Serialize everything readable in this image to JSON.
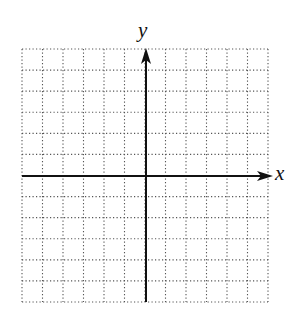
{
  "figure": {
    "type": "coordinate-plane",
    "x_axis_label": "x",
    "y_axis_label": "y",
    "grid": {
      "columns": 12,
      "rows": 12,
      "left": 22,
      "top": 49,
      "right": 268,
      "bottom": 302,
      "line_style": "dotted",
      "line_color": "#555555"
    },
    "axes": {
      "origin_x": 146,
      "origin_y": 176,
      "color": "#111111",
      "x_axis_arrow_tip": 273,
      "y_axis_arrow_tip": 48
    }
  }
}
